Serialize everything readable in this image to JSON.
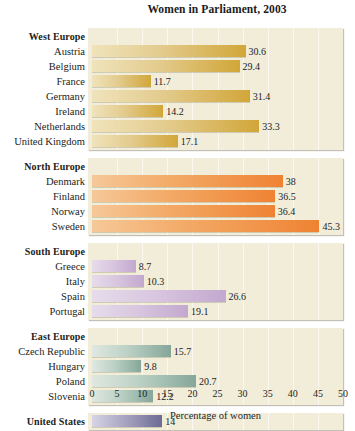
{
  "chart_data": {
    "type": "bar",
    "orientation": "horizontal",
    "title": "Women in Parliament, 2003",
    "xlabel": "Percentage of women",
    "ylabel": "",
    "xlim": [
      0,
      50
    ],
    "xticks": [
      0,
      5,
      10,
      15,
      20,
      25,
      30,
      35,
      40,
      45,
      50
    ],
    "grid": "vertical",
    "legend": "none",
    "groups": [
      {
        "name": "West Europe",
        "color": "#d2a73a",
        "categories": [
          "Austria",
          "Belgium",
          "France",
          "Germany",
          "Ireland",
          "Netherlands",
          "United Kingdom"
        ],
        "values": [
          30.6,
          29.4,
          11.7,
          31.4,
          14.2,
          33.3,
          17.1
        ],
        "labels": [
          "30.6",
          "29.4",
          "11.7",
          "31.4",
          "14.2",
          "33.3",
          "17.1"
        ]
      },
      {
        "name": "North Europe",
        "color": "#ef8333",
        "categories": [
          "Denmark",
          "Finland",
          "Norway",
          "Sweden"
        ],
        "values": [
          38,
          36.5,
          36.4,
          45.3
        ],
        "labels": [
          "38",
          "36.5",
          "36.4",
          "45.3"
        ]
      },
      {
        "name": "South Europe",
        "color": "#c3a9cf",
        "categories": [
          "Greece",
          "Italy",
          "Spain",
          "Portugal"
        ],
        "values": [
          8.7,
          10.3,
          26.6,
          19.1
        ],
        "labels": [
          "8.7",
          "10.3",
          "26.6",
          "19.1"
        ]
      },
      {
        "name": "East Europe",
        "color": "#86a79a",
        "categories": [
          "Czech Republic",
          "Hungary",
          "Poland",
          "Slovenia"
        ],
        "values": [
          15.7,
          9.8,
          20.7,
          12.2
        ],
        "labels": [
          "15.7",
          "9.8",
          "20.7",
          "12.2"
        ]
      },
      {
        "name": "United States",
        "color": "#6e6b95",
        "categories": [
          "United States"
        ],
        "values": [
          14
        ],
        "labels": [
          "14"
        ],
        "group_is_row": true
      }
    ],
    "panel_background": "#f1edd9"
  },
  "axis": {
    "tick_labels": [
      "0",
      "5",
      "10",
      "15",
      "20",
      "25",
      "30",
      "35",
      "40",
      "45",
      "50"
    ],
    "title": "Percentage of women"
  },
  "title": "Women in Parliament, 2003"
}
